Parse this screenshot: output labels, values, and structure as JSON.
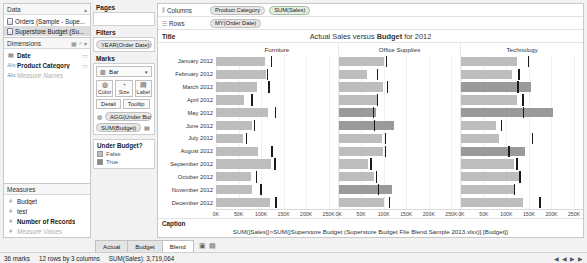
{
  "left_pane": {
    "data_header": {
      "title": "Data",
      "collapse_icon": "chevron-up-icon"
    },
    "sources": [
      {
        "label": "Orders (Sample - Supe...",
        "icon": "database-icon",
        "selected": false
      },
      {
        "label": "Superstore Budget (Su...",
        "icon": "database-icon",
        "selected": true
      }
    ],
    "dimensions_header": {
      "title": "Dimensions",
      "icons": [
        "grid-icon",
        "search-icon",
        "chevron-down-icon"
      ]
    },
    "dimensions": [
      {
        "label": "Date",
        "icon": "calendar-icon",
        "bold": true,
        "dimmed": false
      },
      {
        "label": "Product Category",
        "icon": "abc-icon",
        "bold": true,
        "dimmed": false
      },
      {
        "label": "Measure Names",
        "icon": "abc-icon",
        "bold": false,
        "dimmed": true
      }
    ],
    "measures_header": {
      "title": "Measures"
    },
    "measures": [
      {
        "label": "Budget",
        "icon": "number-icon",
        "bold": false,
        "dimmed": false
      },
      {
        "label": "test",
        "icon": "number-icon",
        "bold": false,
        "dimmed": false
      },
      {
        "label": "Number of Records",
        "icon": "number-icon",
        "bold": true,
        "dimmed": false
      },
      {
        "label": "Measure Values",
        "icon": "number-icon",
        "bold": false,
        "dimmed": true
      }
    ]
  },
  "shelves": {
    "pages": {
      "title": "Pages",
      "content": ""
    },
    "filters": {
      "title": "Filters",
      "pills": [
        "YEAR(Order Date): 2012"
      ]
    },
    "marks": {
      "title": "Marks",
      "mark_type": "Bar",
      "mark_type_icon": "bar-chart-icon",
      "dropdown_icon": "chevron-down-icon",
      "buttons": [
        {
          "label": "Color",
          "icon": "color-icon"
        },
        {
          "label": "Size",
          "icon": "size-icon"
        },
        {
          "label": "Label",
          "icon": "label-icon"
        }
      ],
      "buttons_row2": [
        {
          "label": "Detail",
          "icon": "detail-icon"
        },
        {
          "label": "Tooltip",
          "icon": "tooltip-icon"
        }
      ],
      "mark_pills": [
        {
          "icon": "color-icon",
          "label": "AGG(Under Budget..."
        },
        {
          "icon": "label-icon",
          "label": "SUM(Budget)"
        }
      ]
    },
    "legend": {
      "title": "Under Budget?",
      "items": [
        {
          "label": "False",
          "color": "#bdbdbd"
        },
        {
          "label": "True",
          "color": "#8a8a8a"
        }
      ]
    }
  },
  "viz": {
    "columns_label": "Columns",
    "columns_icon": "columns-icon",
    "columns_pills": [
      "Product Category",
      "SUM(Sales)"
    ],
    "rows_label": "Rows",
    "rows_icon": "rows-icon",
    "rows_pills": [
      "MY(Order Date)"
    ],
    "title_label": "Title",
    "title_prefix": "Actual Sales versus ",
    "title_bold": "Budget",
    "title_suffix": " for 2012",
    "caption_label": "Caption",
    "caption_text": "SUM([Sales])>SUM([Superstore Budget (Superstore Budget File Blend Sample 2013.xlsx)].[Budget])"
  },
  "chart_data": {
    "type": "bar",
    "title": "Actual Sales versus Budget for 2012",
    "xlabel": "SUM(Sales)",
    "ylabel": "MY(Order Date)",
    "xlim": [
      0,
      270000
    ],
    "ticks": [
      "0K",
      "50K",
      "100K",
      "150K",
      "200K",
      "250K"
    ],
    "tick_values": [
      0,
      50000,
      100000,
      150000,
      200000,
      250000
    ],
    "grid": true,
    "legend": "Under Budget?",
    "categories": [
      "January 2012",
      "February 2012",
      "March 2012",
      "April 2012",
      "May 2012",
      "June 2012",
      "July 2012",
      "August 2012",
      "September 2012",
      "October 2012",
      "November 2012",
      "December 2012"
    ],
    "panels": [
      {
        "name": "Furniture",
        "series": [
          {
            "name": "Sales",
            "values": [
              108000,
              112000,
              90000,
              62000,
              115000,
              80000,
              60000,
              93000,
              122000,
              78000,
              80000,
              120000
            ]
          },
          {
            "name": "Budget",
            "values": [
              122000,
              113000,
              116000,
              78000,
              130000,
              84000,
              66000,
              123000,
              129000,
              88000,
              98000,
              132000
            ]
          }
        ],
        "under_budget": [
          true,
          true,
          true,
          true,
          true,
          true,
          true,
          true,
          true,
          true,
          true,
          true
        ]
      },
      {
        "name": "Office Supplies",
        "series": [
          {
            "name": "Sales",
            "values": [
              101000,
              62000,
              99000,
              84000,
              83000,
              122000,
              96000,
              98000,
              66000,
              78000,
              118000,
              101000
            ]
          },
          {
            "name": "Budget",
            "values": [
              104000,
              84000,
              107000,
              84000,
              76000,
              78000,
              103000,
              103000,
              70000,
              82000,
              87000,
              111000
            ]
          }
        ],
        "under_budget": [
          true,
          true,
          true,
          true,
          false,
          false,
          true,
          true,
          true,
          true,
          false,
          true
        ]
      },
      {
        "name": "Technology",
        "series": [
          {
            "name": "Sales",
            "values": [
              123000,
              113000,
              155000,
              124000,
              204000,
              77000,
              84000,
              142000,
              117000,
              128000,
              116000,
              136000
            ]
          },
          {
            "name": "Budget",
            "values": [
              148000,
              126000,
              124000,
              135000,
              136000,
              88000,
              157000,
              104000,
              122000,
              129000,
              116000,
              173000
            ]
          }
        ],
        "under_budget": [
          true,
          true,
          false,
          true,
          false,
          true,
          true,
          false,
          true,
          true,
          true,
          true
        ]
      }
    ]
  },
  "tabs": {
    "items": [
      {
        "label": "Actual",
        "active": false
      },
      {
        "label": "Budget",
        "active": false
      },
      {
        "label": "Blend",
        "active": true
      }
    ],
    "icons": [
      "new-sheet-icon",
      "new-dashboard-icon"
    ]
  },
  "status": {
    "marks": "36 marks",
    "rows_cols": "12 rows by 3 columns",
    "sum": "SUM(Sales): 3,719,064",
    "nav": "◀ ◀ ▶ ▶"
  },
  "colors": {
    "bar_under": "#bdbdbd",
    "bar_over": "#9a9a9a",
    "reference_line": "#1c1c1c",
    "selected_source": "#dcdcdc"
  }
}
